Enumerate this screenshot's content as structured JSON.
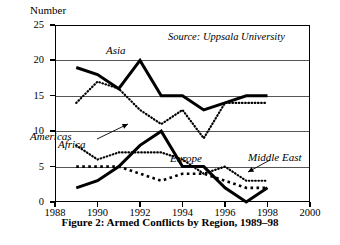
{
  "caption": "Figure 2: Armed Conflicts by Region, 1989–98",
  "source_note": "Source: Uppsala University",
  "chart_data": {
    "type": "line",
    "title": "Figure 2: Armed Conflicts by Region, 1989–98",
    "xlabel": "",
    "ylabel": "Number",
    "xlim": [
      1988,
      2000
    ],
    "ylim": [
      0,
      25
    ],
    "grid": true,
    "legend": "inline-annotations",
    "xticks": [
      1988,
      1990,
      1992,
      1994,
      1996,
      1998,
      2000
    ],
    "yticks": [
      0,
      5,
      10,
      15,
      20,
      25
    ],
    "x": [
      1989,
      1990,
      1991,
      1992,
      1993,
      1994,
      1995,
      1996,
      1997,
      1998
    ],
    "series": [
      {
        "name": "Asia",
        "style": "thick-solid",
        "values": [
          19,
          18,
          16,
          20,
          15,
          15,
          13,
          14,
          15,
          15
        ]
      },
      {
        "name": "Africa",
        "style": "fine-dotted",
        "values": [
          14,
          17,
          16,
          13,
          11,
          13,
          9,
          14,
          14,
          14
        ]
      },
      {
        "name": "Europe",
        "style": "thick-solid",
        "values": [
          2,
          3,
          5,
          8,
          10,
          5,
          5,
          2,
          0,
          2
        ]
      },
      {
        "name": "Americas",
        "style": "fine-dotted",
        "values": [
          8,
          6,
          7,
          7,
          7,
          6,
          4,
          5,
          3,
          3
        ]
      },
      {
        "name": "Middle East",
        "style": "square-dotted",
        "values": [
          5,
          5,
          5,
          4,
          3,
          4,
          4,
          3,
          2,
          2
        ]
      }
    ]
  },
  "annotations": [
    {
      "label": "Asia",
      "x": 106,
      "y": 44
    },
    {
      "label": "Africa",
      "x": 58,
      "y": 138
    },
    {
      "label": "Americas",
      "x": 30,
      "y": 130
    },
    {
      "label": "Europe",
      "x": 170,
      "y": 152
    },
    {
      "label": "Middle East",
      "x": 248,
      "y": 151
    }
  ]
}
